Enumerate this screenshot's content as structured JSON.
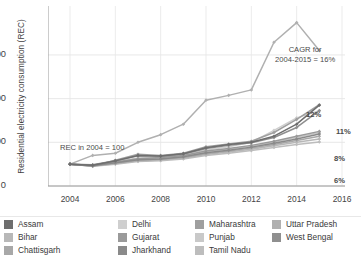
{
  "axes": {
    "ylabel": "Residential electricity consumption (REC)",
    "yticks": [
      "0",
      "200",
      "400",
      "600"
    ],
    "xticks": [
      "2004",
      "2006",
      "2008",
      "2010",
      "2012",
      "2014",
      "2016"
    ]
  },
  "annotations": {
    "cagr_line1": "CAGR for",
    "cagr_line2": "2004-2015 = 16%",
    "base": "REC in 2004 = 100",
    "pct_12": "12%",
    "pct_11": "11%",
    "pct_8": "8%",
    "pct_6": "6%"
  },
  "legend": {
    "columns": [
      [
        {
          "label": "Assam",
          "color": "#6e6e6e"
        },
        {
          "label": "Bihar",
          "color": "#b8b8b8"
        },
        {
          "label": "Chattisgarh",
          "color": "#a8a8a8"
        }
      ],
      [
        {
          "label": "Delhi",
          "color": "#cfcfcf"
        },
        {
          "label": "Gujarat",
          "color": "#9a9a9a"
        },
        {
          "label": "Jharkhand",
          "color": "#8a8a8a"
        }
      ],
      [
        {
          "label": "Maharashtra",
          "color": "#9f9f9f"
        },
        {
          "label": "Punjab",
          "color": "#c9c9c9"
        },
        {
          "label": "Tamil Nadu",
          "color": "#bdbdbd"
        }
      ],
      [
        {
          "label": "Uttar Pradesh",
          "color": "#b0b0b0"
        },
        {
          "label": "West Bengal",
          "color": "#8f8f8f"
        }
      ]
    ]
  },
  "chart_data": {
    "type": "line",
    "title": "",
    "xlabel": "",
    "ylabel": "Residential electricity consumption (REC)",
    "xlim": [
      2004,
      2016
    ],
    "ylim": [
      0,
      760
    ],
    "yticks": [
      0,
      200,
      400,
      600
    ],
    "xticks": [
      2004,
      2006,
      2008,
      2010,
      2012,
      2014,
      2016
    ],
    "grid": true,
    "legend_position": "bottom",
    "note": "REC in 2004 = 100; CAGR for 2004-2015 = 16% for the top series",
    "x": [
      2004,
      2005,
      2006,
      2007,
      2008,
      2009,
      2010,
      2011,
      2012,
      2013,
      2014,
      2015
    ],
    "series": [
      {
        "name": "Uttar Pradesh",
        "color": "#b0b0b0",
        "cagr_label": "16%",
        "values": [
          100,
          140,
          150,
          200,
          235,
          283,
          393,
          415,
          440,
          658,
          748,
          620
        ]
      },
      {
        "name": "Maharashtra",
        "color": "#9f9f9f",
        "cagr_label": "12%",
        "values": [
          100,
          92,
          118,
          145,
          140,
          150,
          180,
          192,
          205,
          245,
          305,
          372
        ]
      },
      {
        "name": "Assam",
        "color": "#6e6e6e",
        "cagr_label": "11%",
        "values": [
          100,
          95,
          115,
          140,
          137,
          148,
          175,
          190,
          200,
          228,
          283,
          370
        ]
      },
      {
        "name": "West Bengal",
        "color": "#8f8f8f",
        "cagr_label": "",
        "values": [
          100,
          97,
          116,
          138,
          136,
          146,
          172,
          186,
          198,
          222,
          268,
          345
        ]
      },
      {
        "name": "Delhi",
        "color": "#cfcfcf",
        "cagr_label": "8%",
        "values": [
          100,
          96,
          112,
          128,
          133,
          145,
          165,
          180,
          200,
          255,
          312,
          345
        ]
      },
      {
        "name": "Gujarat",
        "color": "#9a9a9a",
        "cagr_label": "",
        "values": [
          100,
          95,
          110,
          125,
          130,
          140,
          160,
          172,
          186,
          205,
          228,
          250
        ]
      },
      {
        "name": "Punjab",
        "color": "#c9c9c9",
        "cagr_label": "",
        "values": [
          100,
          94,
          108,
          122,
          127,
          138,
          156,
          168,
          182,
          200,
          222,
          245
        ]
      },
      {
        "name": "Jharkhand",
        "color": "#8a8a8a",
        "cagr_label": "",
        "values": [
          100,
          93,
          106,
          120,
          124,
          134,
          152,
          164,
          178,
          196,
          215,
          238
        ]
      },
      {
        "name": "Chattisgarh",
        "color": "#a8a8a8",
        "cagr_label": "",
        "values": [
          100,
          92,
          104,
          118,
          122,
          131,
          148,
          160,
          174,
          190,
          208,
          228
        ]
      },
      {
        "name": "Bihar",
        "color": "#b8b8b8",
        "cagr_label": "",
        "values": [
          100,
          91,
          102,
          115,
          119,
          128,
          144,
          156,
          168,
          184,
          200,
          215
        ]
      },
      {
        "name": "Tamil Nadu",
        "color": "#bdbdbd",
        "cagr_label": "6%",
        "values": [
          100,
          90,
          100,
          112,
          116,
          124,
          140,
          150,
          162,
          176,
          190,
          202
        ]
      }
    ]
  }
}
